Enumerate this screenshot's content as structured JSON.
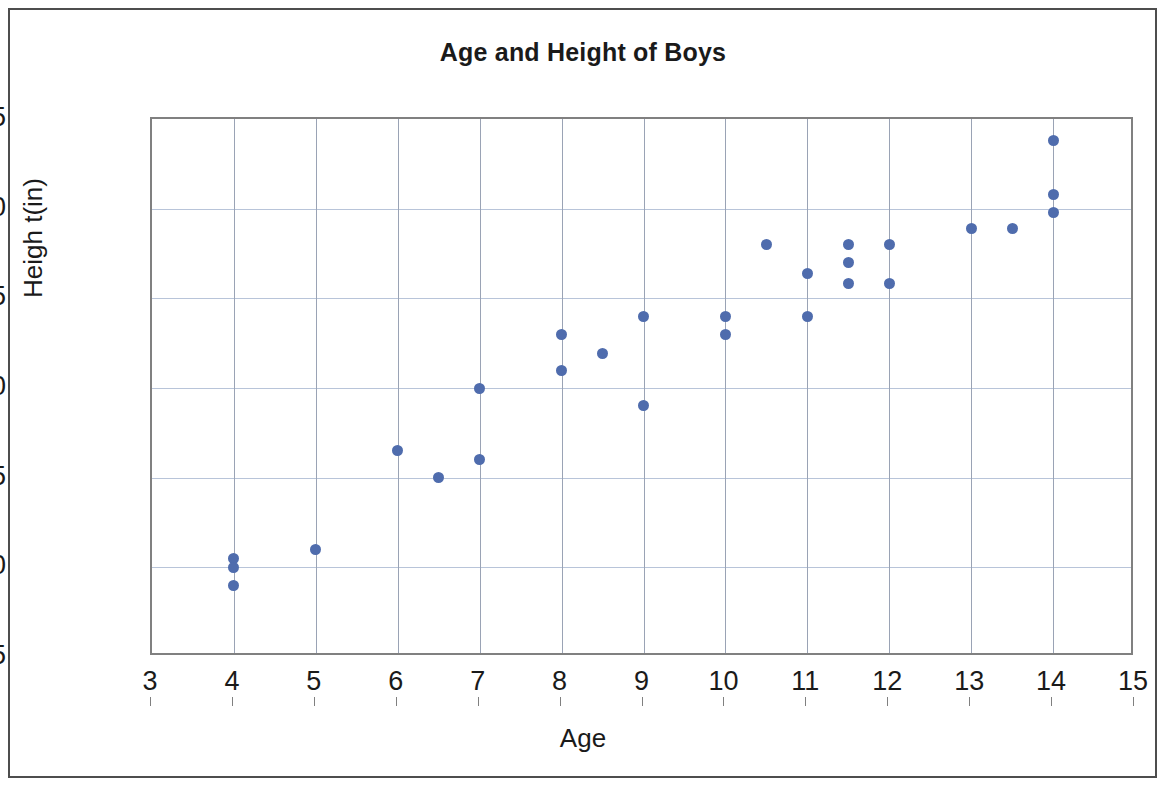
{
  "chart_data": {
    "type": "scatter",
    "title": "Age and Height of Boys",
    "xlabel": "Age",
    "ylabel": "Heigh t(in)",
    "xlim": [
      3,
      15
    ],
    "ylim": [
      35,
      65
    ],
    "xticks": [
      3,
      4,
      5,
      6,
      7,
      8,
      9,
      10,
      11,
      12,
      13,
      14,
      15
    ],
    "yticks": [
      35,
      40,
      45,
      50,
      55,
      60,
      65
    ],
    "grid": true,
    "legend": null,
    "marker_color": "#4f6cad",
    "gridline_color": "#b8c4d9",
    "axis_color": "#808080",
    "frame_color": "#4d4d4d",
    "series": [
      {
        "name": "Boys",
        "points": [
          {
            "x": 4,
            "y": 40.5
          },
          {
            "x": 4,
            "y": 40.0
          },
          {
            "x": 4,
            "y": 39.0
          },
          {
            "x": 5,
            "y": 41.0
          },
          {
            "x": 6,
            "y": 46.5
          },
          {
            "x": 6.5,
            "y": 45.0
          },
          {
            "x": 7,
            "y": 50.0
          },
          {
            "x": 7,
            "y": 46.0
          },
          {
            "x": 8,
            "y": 53.0
          },
          {
            "x": 8,
            "y": 51.0
          },
          {
            "x": 8.5,
            "y": 51.9
          },
          {
            "x": 9,
            "y": 54.0
          },
          {
            "x": 9,
            "y": 49.0
          },
          {
            "x": 10,
            "y": 54.0
          },
          {
            "x": 10,
            "y": 53.0
          },
          {
            "x": 10.5,
            "y": 58.0
          },
          {
            "x": 11,
            "y": 56.4
          },
          {
            "x": 11,
            "y": 54.0
          },
          {
            "x": 11.5,
            "y": 58.0
          },
          {
            "x": 11.5,
            "y": 57.0
          },
          {
            "x": 11.5,
            "y": 55.8
          },
          {
            "x": 12,
            "y": 58.0
          },
          {
            "x": 12,
            "y": 55.8
          },
          {
            "x": 13,
            "y": 58.9
          },
          {
            "x": 13.5,
            "y": 58.9
          },
          {
            "x": 14,
            "y": 63.8
          },
          {
            "x": 14,
            "y": 60.8
          },
          {
            "x": 14,
            "y": 59.8
          }
        ]
      }
    ]
  }
}
